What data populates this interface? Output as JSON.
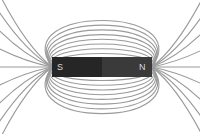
{
  "diagram": {
    "magnet": {
      "south_label": "S",
      "north_label": "N",
      "south_color": "#262626",
      "north_color": "#3a3a3a"
    },
    "field_line_color": "#9a9a9a"
  }
}
